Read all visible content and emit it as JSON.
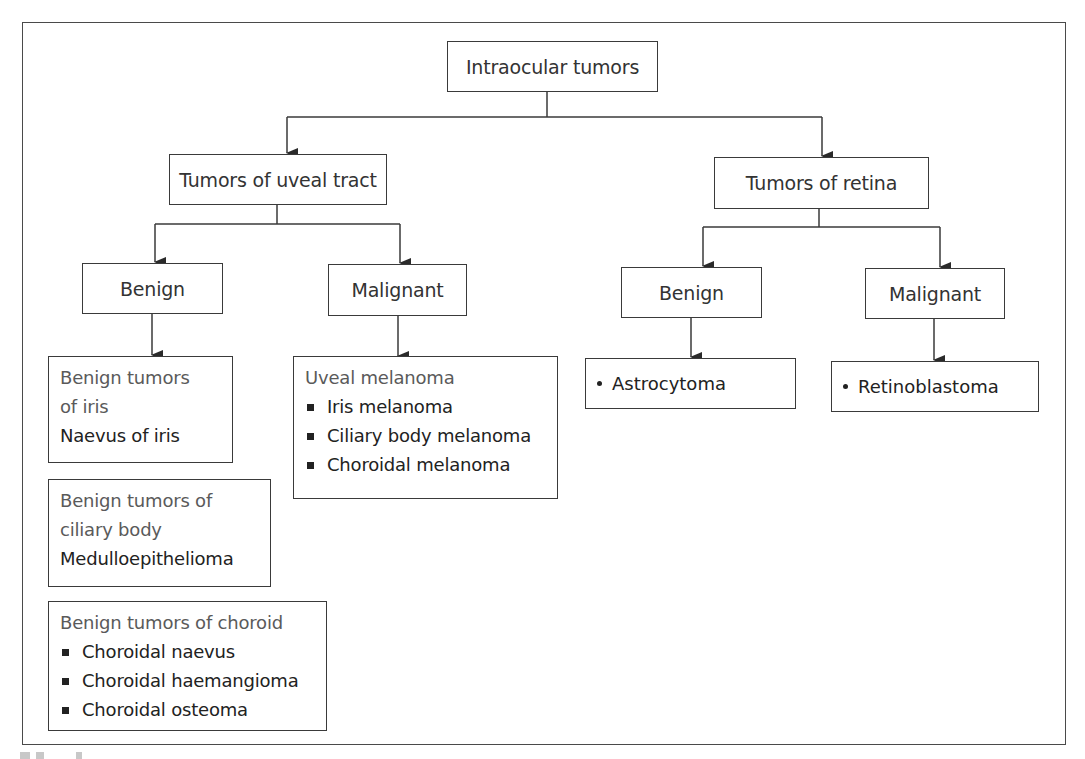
{
  "diagram": {
    "root": {
      "label": "Intraocular tumors"
    },
    "uveal": {
      "label": "Tumors of uveal tract",
      "benign": {
        "label": "Benign",
        "groups": [
          {
            "header": "Benign tumors of iris",
            "header_lines": [
              "Benign tumors",
              "of iris"
            ],
            "items": [
              "Naevus of iris"
            ]
          },
          {
            "header": "Benign tumors of ciliary body",
            "header_lines": [
              "Benign tumors of",
              "ciliary body"
            ],
            "items": [
              "Medulloepithelioma"
            ]
          },
          {
            "header": "Benign tumors of choroid",
            "header_lines": [
              "Benign tumors of choroid"
            ],
            "items": [
              "Choroidal naevus",
              "Choroidal haemangioma",
              "Choroidal osteoma"
            ]
          }
        ]
      },
      "malignant": {
        "label": "Malignant",
        "group": {
          "header": "Uveal melanoma",
          "items": [
            "Iris melanoma",
            "Ciliary body melanoma",
            "Choroidal melanoma"
          ]
        }
      }
    },
    "retina": {
      "label": "Tumors of retina",
      "benign": {
        "label": "Benign",
        "items": [
          "Astrocytoma"
        ]
      },
      "malignant": {
        "label": "Malignant",
        "items": [
          "Retinoblastoma"
        ]
      }
    },
    "colors": {
      "line": "#3a3a3a",
      "header_text": "#5a5a5a",
      "item_text": "#222222"
    }
  }
}
